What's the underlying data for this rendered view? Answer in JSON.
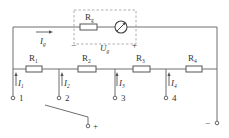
{
  "diagram": {
    "meter": {
      "resistor_label": "R",
      "resistor_sub": "g",
      "voltage_label": "U",
      "voltage_sub": "g",
      "minus": "−",
      "plus": "+",
      "current_label": "I",
      "current_sub": "g"
    },
    "resistors": [
      {
        "label": "R",
        "sub": "1"
      },
      {
        "label": "R",
        "sub": "2"
      },
      {
        "label": "R",
        "sub": "3"
      },
      {
        "label": "R",
        "sub": "4"
      }
    ],
    "branch_currents": [
      {
        "label": "I",
        "sub": "1"
      },
      {
        "label": "I",
        "sub": "2"
      },
      {
        "label": "I",
        "sub": "3"
      },
      {
        "label": "I",
        "sub": "4"
      }
    ],
    "terminals": [
      "1",
      "2",
      "3",
      "4"
    ],
    "common_plus": "+",
    "common_minus": "−"
  }
}
